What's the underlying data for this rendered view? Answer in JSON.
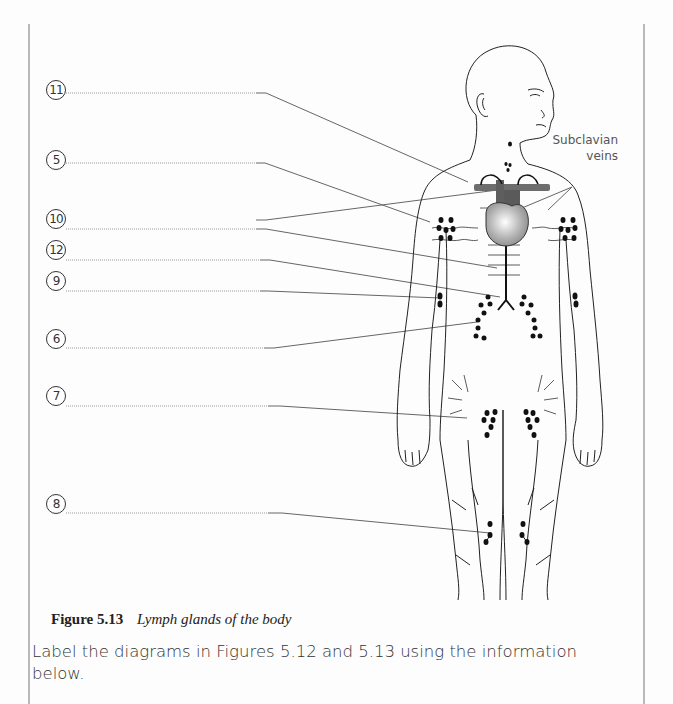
{
  "figure": {
    "number": "Figure 5.13",
    "title": "Lymph glands of the body",
    "callout": {
      "line1": "Subclavian",
      "line2": "veins"
    },
    "labels": [
      {
        "id": "11",
        "y": 92
      },
      {
        "id": "5",
        "y": 162
      },
      {
        "id": "10",
        "y": 229
      },
      {
        "id": "12",
        "y": 259
      },
      {
        "id": "9",
        "y": 290
      },
      {
        "id": "6",
        "y": 347
      },
      {
        "id": "7",
        "y": 405
      },
      {
        "id": "8",
        "y": 506
      }
    ]
  },
  "instruction": {
    "text": "Label the diagrams in Figures 5.12 and 5.13 using the information below."
  },
  "colors": {
    "line": "#555555",
    "dotted_line": "#9a9a9a",
    "node": "#111111",
    "heart": "#b0b0b0",
    "vessel": "#6d6d6d"
  }
}
